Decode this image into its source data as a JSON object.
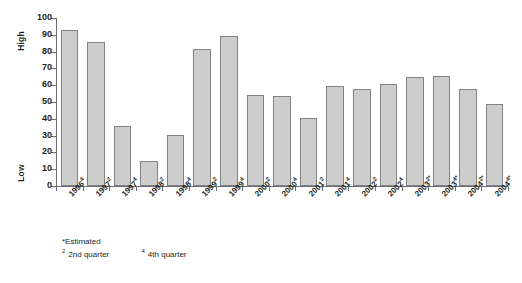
{
  "chart_data": {
    "type": "bar",
    "title": "",
    "subtitle": "",
    "xlabel": "",
    "ylabel": "",
    "ylim": [
      0,
      100
    ],
    "ytick_step": 10,
    "yticks": [
      0,
      10,
      20,
      30,
      40,
      50,
      60,
      70,
      80,
      90,
      100
    ],
    "grid": false,
    "legend": null,
    "categories": [
      "1996⁴",
      "1997²",
      "1997⁴",
      "1998²",
      "1998⁴",
      "1999²",
      "1999⁴",
      "2000²",
      "2000⁴",
      "2001²",
      "2001⁴",
      "2002²",
      "2002⁴",
      "2003²*",
      "2003⁴*",
      "2004²*",
      "2004⁴*"
    ],
    "category_parts": [
      {
        "base": "1996",
        "sup": "4"
      },
      {
        "base": "1997",
        "sup": "2"
      },
      {
        "base": "1997",
        "sup": "4"
      },
      {
        "base": "1998",
        "sup": "2"
      },
      {
        "base": "1998",
        "sup": "4"
      },
      {
        "base": "1999",
        "sup": "2"
      },
      {
        "base": "1999",
        "sup": "4"
      },
      {
        "base": "2000",
        "sup": "2"
      },
      {
        "base": "2000",
        "sup": "4"
      },
      {
        "base": "2001",
        "sup": "2"
      },
      {
        "base": "2001",
        "sup": "4"
      },
      {
        "base": "2002",
        "sup": "2"
      },
      {
        "base": "2002",
        "sup": "4"
      },
      {
        "base": "2003",
        "sup": "2*"
      },
      {
        "base": "2003",
        "sup": "4*"
      },
      {
        "base": "2004",
        "sup": "2*"
      },
      {
        "base": "2004",
        "sup": "4*"
      }
    ],
    "values": [
      93,
      85.5,
      35.5,
      15,
      30.5,
      81.5,
      89.5,
      54,
      53.5,
      40.5,
      59.5,
      57.5,
      61,
      65,
      65.5,
      58,
      49
    ],
    "bar_color": "#cdcdcd",
    "bar_border_color": "#808285",
    "axis_color": "#6d6e71"
  },
  "axis": {
    "high_label": "High",
    "low_label": "Low"
  },
  "footnotes": {
    "estimated": "*Estimated",
    "q2_marker": "2",
    "q2_text": "2nd quarter",
    "q4_marker": "4",
    "q4_text": "4th quarter"
  }
}
